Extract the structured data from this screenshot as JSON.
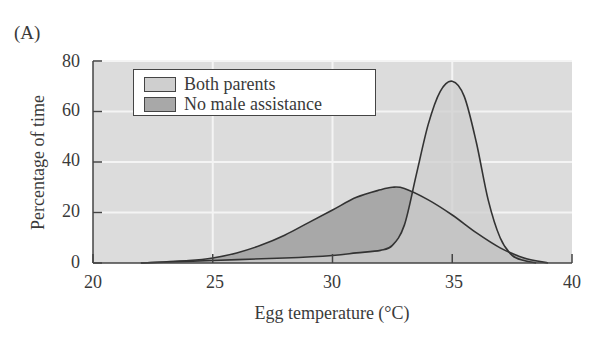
{
  "panel_label": "(A)",
  "colors": {
    "plot_bg": "#dcdcdc",
    "gridline": "#f4f4f4",
    "both_parents_fill": "#cfcfcf",
    "no_male_fill": "#a8a8a8",
    "line": "#333333"
  },
  "legend": {
    "items": [
      {
        "label": "Both parents"
      },
      {
        "label": "No male assistance"
      }
    ]
  },
  "axes": {
    "xlabel": "Egg temperature (°C)",
    "ylabel": "Percentage of time",
    "xticks": [
      "20",
      "25",
      "30",
      "35",
      "40"
    ],
    "yticks": [
      "0",
      "20",
      "40",
      "60",
      "80"
    ]
  },
  "chart_data": {
    "type": "area",
    "title": "",
    "panel": "(A)",
    "xlabel": "Egg temperature (°C)",
    "ylabel": "Percentage of time",
    "xlim": [
      20,
      40
    ],
    "ylim": [
      0,
      80
    ],
    "xticks": [
      20,
      25,
      30,
      35,
      40
    ],
    "yticks": [
      0,
      20,
      40,
      60,
      80
    ],
    "grid": true,
    "legend_position": "upper left",
    "series": [
      {
        "name": "Both parents",
        "x": [
          22,
          25,
          28,
          30,
          31,
          32,
          32.5,
          33,
          33.5,
          34,
          34.5,
          35,
          35.5,
          36,
          36.5,
          37,
          37.5,
          38,
          38.5
        ],
        "values": [
          0,
          1,
          2,
          3,
          4,
          5,
          7,
          15,
          35,
          55,
          68,
          72,
          66,
          48,
          25,
          10,
          3,
          1,
          0
        ]
      },
      {
        "name": "No male assistance",
        "x": [
          22,
          24,
          25,
          26,
          27,
          28,
          29,
          30,
          31,
          32,
          32.5,
          33,
          34,
          35,
          36,
          37,
          38,
          39
        ],
        "values": [
          0,
          1,
          2,
          4,
          7,
          11,
          16,
          21,
          26,
          29,
          30,
          29.5,
          25,
          19,
          12,
          6,
          2,
          0
        ]
      }
    ]
  }
}
